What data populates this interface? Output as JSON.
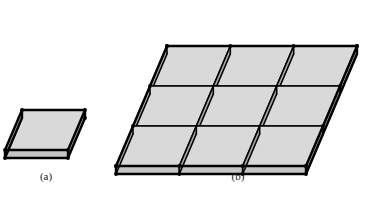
{
  "figure": {
    "width": 369,
    "height": 209,
    "background_color": "#ffffff",
    "panels": [
      {
        "id": "a",
        "caption": "(a)",
        "title": "single unit cell",
        "cell_count": 1,
        "rows": 1,
        "cols": 1
      },
      {
        "id": "b",
        "caption": "(b)",
        "title": "three by three array of unit cells",
        "cell_count": 9,
        "rows": 3,
        "cols": 3
      }
    ],
    "style": {
      "edge_color": "#000000",
      "top_face_color": "#d9d9d9",
      "side_face_color": "#a8a8a8",
      "front_face_color": "#c4c4c4",
      "edge_width_outer": 2.4,
      "edge_width_inner": 1.6
    },
    "geometry": {
      "panel_a": {
        "origin_x": 5,
        "origin_y": 150,
        "vec_u_x": 63,
        "vec_u_y": 0,
        "vec_v_x": 17,
        "vec_v_y": -40,
        "thickness": 8
      },
      "panel_b": {
        "origin_x": 116,
        "origin_y": 166,
        "vec_u_x": 190,
        "vec_u_y": 0,
        "vec_v_x": 51,
        "vec_v_y": -120,
        "thickness": 8,
        "divisions_u": 3,
        "divisions_v": 3
      }
    }
  }
}
